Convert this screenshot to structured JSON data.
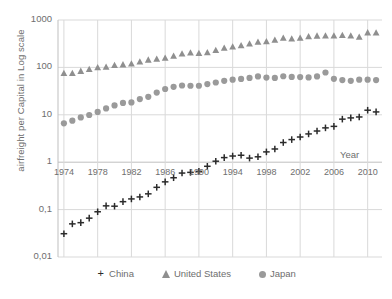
{
  "chart_data": {
    "type": "scatter",
    "title": "",
    "xlabel": "Year",
    "ylabel": "airfreight  per Capital in Log scale",
    "yscale": "log",
    "ylim": [
      0.01,
      1000
    ],
    "xlim": [
      1973.3,
      2011.7
    ],
    "grid": true,
    "legend_position": "bottom",
    "ytick_labels": [
      "1000",
      "100",
      "10",
      "1",
      "0,1",
      "0,01"
    ],
    "ytick_values": [
      1000,
      100,
      10,
      1,
      0.1,
      0.01
    ],
    "xtick_labels": [
      "1974",
      "1978",
      "1982",
      "1986",
      "1990",
      "1994",
      "1998",
      "2002",
      "2006",
      "2010"
    ],
    "xtick_values": [
      1974,
      1978,
      1982,
      1986,
      1990,
      1994,
      1998,
      2002,
      2006,
      2010
    ],
    "x": [
      1974,
      1975,
      1976,
      1977,
      1978,
      1979,
      1980,
      1981,
      1982,
      1983,
      1984,
      1985,
      1986,
      1987,
      1988,
      1989,
      1990,
      1991,
      1992,
      1993,
      1994,
      1995,
      1996,
      1997,
      1998,
      1999,
      2000,
      2001,
      2002,
      2003,
      2004,
      2005,
      2006,
      2007,
      2008,
      2009,
      2010,
      2011
    ],
    "series": [
      {
        "name": "China",
        "marker": "plus",
        "color": "#2b2b2b",
        "values": [
          0.031,
          0.05,
          0.053,
          0.066,
          0.09,
          0.12,
          0.118,
          0.147,
          0.168,
          0.185,
          0.215,
          0.295,
          0.385,
          0.47,
          0.59,
          0.61,
          0.64,
          0.82,
          1.05,
          1.25,
          1.35,
          1.4,
          1.22,
          1.3,
          1.65,
          1.9,
          2.6,
          3.0,
          3.4,
          3.95,
          4.55,
          5.3,
          5.7,
          8.1,
          8.6,
          9.0,
          12.5,
          11.5
        ]
      },
      {
        "name": "United States",
        "marker": "triangle",
        "color": "#8f8f8f",
        "values": [
          76,
          76,
          84,
          92,
          100,
          103,
          112,
          115,
          120,
          133,
          145,
          152,
          158,
          175,
          195,
          205,
          200,
          208,
          232,
          258,
          275,
          290,
          318,
          345,
          355,
          380,
          420,
          405,
          420,
          450,
          465,
          470,
          470,
          480,
          470,
          440,
          545,
          540
        ]
      },
      {
        "name": "Japan",
        "marker": "circle",
        "color": "#9a9a9a",
        "values": [
          6.6,
          7.5,
          8.8,
          9.9,
          11.5,
          13.6,
          15.8,
          17.8,
          18.2,
          21.5,
          24.0,
          29.5,
          35.0,
          39.0,
          41.5,
          41.0,
          41.0,
          44.5,
          48.0,
          52.0,
          55.0,
          57.0,
          60.0,
          64.5,
          61.0,
          60.0,
          65.0,
          63.0,
          62.5,
          61.5,
          64.5,
          78.0,
          57.5,
          54.0,
          52.0,
          55.0,
          55.0,
          54.0
        ]
      }
    ]
  },
  "legend": {
    "items": [
      {
        "label": "China",
        "marker": "plus-marker"
      },
      {
        "label": "United States",
        "marker": "triangle-marker"
      },
      {
        "label": "Japan",
        "marker": "circle-marker"
      }
    ]
  },
  "colors": {
    "china": "#2b2b2b",
    "united_states": "#8f8f8f",
    "japan": "#9a9a9a",
    "grid": "#d9d9d9",
    "axis": "#bfbfbf",
    "text": "#6e6e6e"
  }
}
